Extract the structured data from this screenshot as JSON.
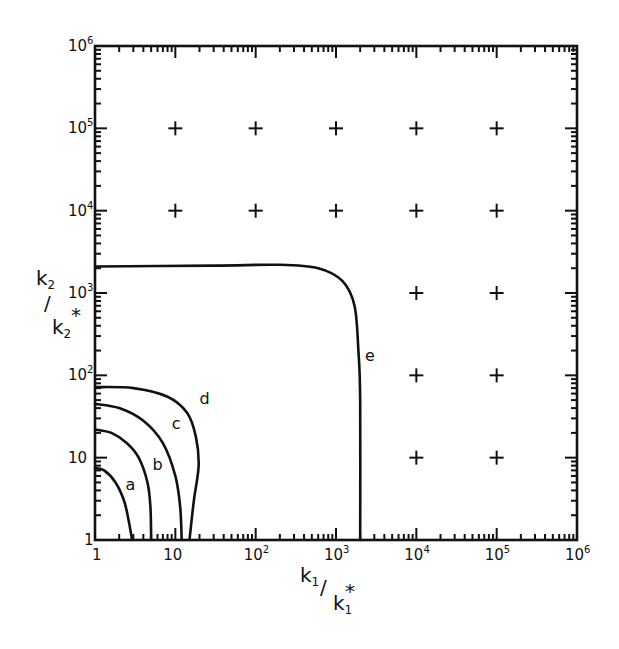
{
  "chart_data": {
    "type": "line",
    "title": "",
    "xlabel": "k1/k1*",
    "ylabel": "k2/k2*",
    "xscale": "log",
    "yscale": "log",
    "xlim": [
      1,
      1000000
    ],
    "ylim": [
      1,
      1000000
    ],
    "grid": false,
    "legend": "none (curves labeled inline a–e)",
    "x_tick_labels": [
      "1",
      "10",
      "10^2",
      "10^3",
      "10^4",
      "10^5",
      "10^6"
    ],
    "y_tick_labels": [
      "1",
      "10",
      "10^2",
      "10^3",
      "10^4",
      "10^5",
      "10^6"
    ],
    "series": [
      {
        "name": "a",
        "points": [
          [
            1,
            7.5
          ],
          [
            1.3,
            7
          ],
          [
            1.8,
            5
          ],
          [
            2.3,
            3
          ],
          [
            2.6,
            1.8
          ],
          [
            2.9,
            1
          ]
        ]
      },
      {
        "name": "b",
        "points": [
          [
            1,
            22
          ],
          [
            1.6,
            20
          ],
          [
            2.5,
            15
          ],
          [
            3.5,
            10
          ],
          [
            4.5,
            5
          ],
          [
            4.9,
            2.5
          ],
          [
            5,
            1
          ]
        ]
      },
      {
        "name": "c",
        "points": [
          [
            1,
            45
          ],
          [
            2,
            40
          ],
          [
            4,
            28
          ],
          [
            7,
            15
          ],
          [
            10,
            6
          ],
          [
            11.5,
            2.5
          ],
          [
            12,
            1
          ]
        ]
      },
      {
        "name": "d",
        "points": [
          [
            1,
            72
          ],
          [
            3,
            70
          ],
          [
            8,
            55
          ],
          [
            14,
            35
          ],
          [
            18,
            18
          ],
          [
            19.5,
            8
          ],
          [
            17,
            3
          ],
          [
            15,
            1
          ]
        ]
      },
      {
        "name": "e",
        "points": [
          [
            1,
            2100
          ],
          [
            30,
            2150
          ],
          [
            200,
            2200
          ],
          [
            600,
            2000
          ],
          [
            1200,
            1400
          ],
          [
            1700,
            700
          ],
          [
            1900,
            200
          ],
          [
            2000,
            50
          ],
          [
            2000,
            1
          ]
        ]
      }
    ],
    "markers": {
      "symbol": "+",
      "points": [
        [
          10,
          100000
        ],
        [
          100,
          100000
        ],
        [
          1000,
          100000
        ],
        [
          10000,
          100000
        ],
        [
          100000,
          100000
        ],
        [
          10,
          10000
        ],
        [
          100,
          10000
        ],
        [
          1000,
          10000
        ],
        [
          10000,
          10000
        ],
        [
          100000,
          10000
        ],
        [
          10000,
          1000
        ],
        [
          100000,
          1000
        ],
        [
          10000,
          100
        ],
        [
          100000,
          100
        ],
        [
          10000,
          10
        ],
        [
          100000,
          10
        ]
      ]
    },
    "annotations": [
      {
        "text": "a",
        "x": 2.4,
        "y": 4
      },
      {
        "text": "b",
        "x": 5.2,
        "y": 7
      },
      {
        "text": "c",
        "x": 9,
        "y": 22
      },
      {
        "text": "d",
        "x": 20,
        "y": 45
      },
      {
        "text": "e",
        "x": 2300,
        "y": 150
      }
    ]
  },
  "labels": {
    "x_axis": {
      "main": "k",
      "sub": "1",
      "slash": "/",
      "den": "k",
      "den_sub": "1",
      "star": "*"
    },
    "y_axis": {
      "main": "k",
      "sub": "2",
      "slash": "/",
      "den": "k",
      "den_sub": "2",
      "star": "*"
    },
    "x_ticks": [
      {
        "base": "1",
        "exp": ""
      },
      {
        "base": "10",
        "exp": ""
      },
      {
        "base": "10",
        "exp": "2"
      },
      {
        "base": "10",
        "exp": "3"
      },
      {
        "base": "10",
        "exp": "4"
      },
      {
        "base": "10",
        "exp": "5"
      },
      {
        "base": "10",
        "exp": "6"
      }
    ],
    "y_ticks": [
      {
        "base": "1",
        "exp": ""
      },
      {
        "base": "10",
        "exp": ""
      },
      {
        "base": "10",
        "exp": "2"
      },
      {
        "base": "10",
        "exp": "3"
      },
      {
        "base": "10",
        "exp": "4"
      },
      {
        "base": "10",
        "exp": "5"
      },
      {
        "base": "10",
        "exp": "6"
      }
    ],
    "curve_labels": [
      "a",
      "b",
      "c",
      "d",
      "e"
    ]
  }
}
